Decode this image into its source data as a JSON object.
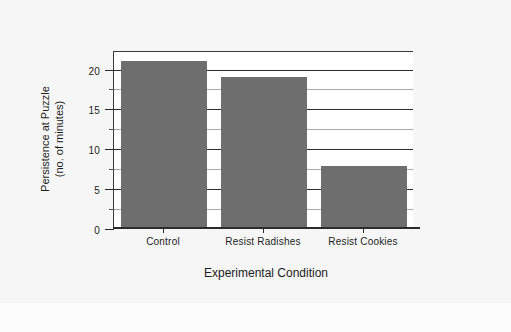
{
  "chart_data": {
    "type": "bar",
    "title": "",
    "subtitle": "",
    "xlabel": "Experimental Condition",
    "ylabel": "Persistence at Puzzle (no. of minutes)",
    "ylabel_line1": "Persistence at Puzzle",
    "ylabel_line2": "(no. of minutes)",
    "categories": [
      "Control",
      "Resist Radishes",
      "Resist Cookies"
    ],
    "values": [
      21,
      19,
      7.8
    ],
    "ylim": [
      0,
      22.2
    ],
    "ytick_labels": [
      "0",
      "5",
      "10",
      "15",
      "20"
    ],
    "ytick_values": [
      0,
      5,
      10,
      15,
      20
    ],
    "yminor_values": [
      2.5,
      7.5,
      12.5,
      17.5
    ],
    "grid": "horizontal",
    "legend": "none",
    "bar_color": "#6e6e6e",
    "grid_color_major": "#2b2b2b",
    "grid_color_minor": "#a9a9a9",
    "axis_color": "#2b2b2b",
    "plot_background": "#ffffff",
    "figure_background": "#f6f6f6"
  }
}
